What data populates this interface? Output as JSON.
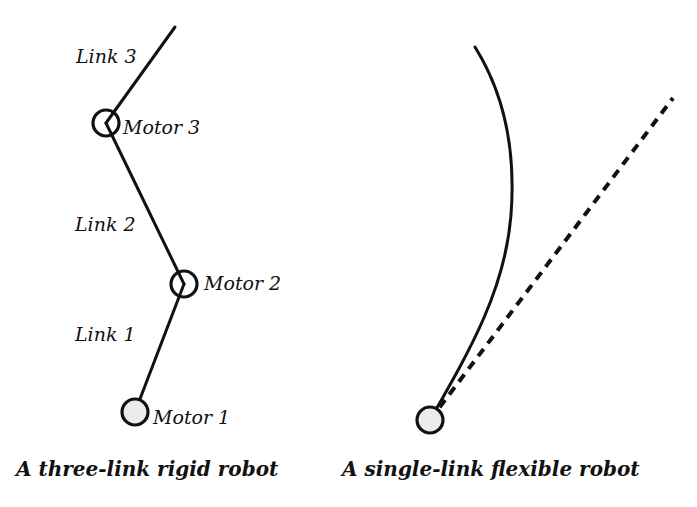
{
  "figure": {
    "rigid_robot": {
      "caption": "A three-link rigid robot",
      "links": [
        {
          "label": "Link 1"
        },
        {
          "label": "Link 2"
        },
        {
          "label": "Link 3"
        }
      ],
      "motors": [
        {
          "label": "Motor 1"
        },
        {
          "label": "Motor 2"
        },
        {
          "label": "Motor 3"
        }
      ]
    },
    "flexible_robot": {
      "caption": "A single-link flexible robot"
    },
    "colors": {
      "stroke": "#111111",
      "motor_fill": "#ececec",
      "background": "#ffffff"
    }
  }
}
